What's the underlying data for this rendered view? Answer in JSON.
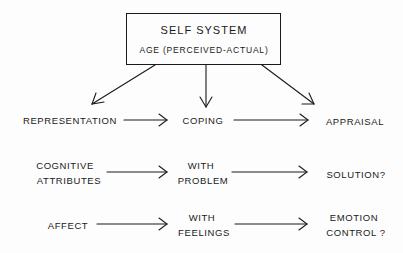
{
  "diagram": {
    "root": {
      "title": "SELF SYSTEM",
      "subtitle": "AGE (PERCEIVED-ACTUAL)"
    },
    "rows": [
      {
        "left": "REPRESENTATION",
        "middle": "COPING",
        "right": "APPRAISAL"
      },
      {
        "left_line1": "COGNITIVE",
        "left_line2": "ATTRIBUTES",
        "middle_line1": "WITH",
        "middle_line2": "PROBLEM",
        "right": "SOLUTION?"
      },
      {
        "left": "AFFECT",
        "middle_line1": "WITH",
        "middle_line2": "FEELINGS",
        "right_line1": "EMOTION",
        "right_line2": "CONTROL ?"
      }
    ],
    "edges": [
      {
        "from": "SELF SYSTEM",
        "to": "REPRESENTATION"
      },
      {
        "from": "SELF SYSTEM",
        "to": "COPING"
      },
      {
        "from": "SELF SYSTEM",
        "to": "APPRAISAL"
      },
      {
        "from": "REPRESENTATION",
        "to": "COPING"
      },
      {
        "from": "COPING",
        "to": "APPRAISAL"
      },
      {
        "from": "COGNITIVE ATTRIBUTES",
        "to": "WITH PROBLEM"
      },
      {
        "from": "WITH PROBLEM",
        "to": "SOLUTION?"
      },
      {
        "from": "AFFECT",
        "to": "WITH FEELINGS"
      },
      {
        "from": "WITH FEELINGS",
        "to": "EMOTION CONTROL ?"
      }
    ],
    "colors": {
      "ink": "#1a1a1a",
      "background": "#fdfdfd"
    }
  }
}
